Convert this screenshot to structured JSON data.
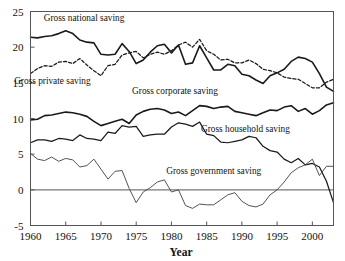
{
  "chart_data": {
    "type": "line",
    "title": "",
    "xlabel": "Year",
    "ylabel": "",
    "xlim": [
      1960,
      2003
    ],
    "ylim": [
      -5,
      25
    ],
    "grid": false,
    "legend": "inline-labels",
    "xticks": [
      1960,
      1965,
      1970,
      1975,
      1980,
      1985,
      1990,
      1995,
      2000
    ],
    "xtick_labels": [
      "1960",
      "1965",
      "1970",
      "1975",
      "1980",
      "1985",
      "1990",
      "1995",
      "2000"
    ],
    "yticks": [
      -5,
      0,
      5,
      10,
      15,
      20,
      25
    ],
    "ytick_labels": [
      "-5",
      "0",
      "5",
      "10",
      "15",
      "20",
      "25"
    ],
    "x": [
      1960,
      1961,
      1962,
      1963,
      1964,
      1965,
      1966,
      1967,
      1968,
      1969,
      1970,
      1971,
      1972,
      1973,
      1974,
      1975,
      1976,
      1977,
      1978,
      1979,
      1980,
      1981,
      1982,
      1983,
      1984,
      1985,
      1986,
      1987,
      1988,
      1989,
      1990,
      1991,
      1992,
      1993,
      1994,
      1995,
      1996,
      1997,
      1998,
      1999,
      2000,
      2001,
      2002,
      2003
    ],
    "series": [
      {
        "name": "Gross national saving",
        "style": "solid",
        "width": "thick",
        "label_x": 1967.6,
        "label_y": 23.6,
        "values": [
          21.4,
          21.3,
          21.5,
          21.6,
          21.9,
          22.3,
          21.9,
          21.0,
          20.7,
          20.6,
          19.0,
          18.9,
          19.0,
          20.5,
          19.4,
          17.7,
          18.2,
          19.3,
          20.2,
          20.4,
          19.2,
          20.3,
          17.6,
          17.8,
          20.2,
          18.5,
          16.8,
          16.8,
          17.6,
          17.4,
          16.2,
          16.0,
          15.4,
          14.9,
          16.0,
          16.4,
          16.9,
          18.0,
          18.6,
          18.4,
          17.9,
          16.3,
          14.4,
          13.8
        ]
      },
      {
        "name": "Gross private saving",
        "style": "dashed",
        "width": "med",
        "label_x": 1963.1,
        "label_y": 14.9,
        "values": [
          16.3,
          17.0,
          17.4,
          17.3,
          17.9,
          18.0,
          17.7,
          18.4,
          17.5,
          16.7,
          16.0,
          17.4,
          17.6,
          18.9,
          19.2,
          19.4,
          18.5,
          19.0,
          19.3,
          19.0,
          19.5,
          20.3,
          20.7,
          20.0,
          21.1,
          19.5,
          19.0,
          18.2,
          18.3,
          17.8,
          17.8,
          18.2,
          17.7,
          16.9,
          16.7,
          16.4,
          15.8,
          15.6,
          15.5,
          14.9,
          14.3,
          14.3,
          15.1,
          15.5
        ]
      },
      {
        "name": "Gross corporate saving",
        "style": "solid",
        "width": "thick",
        "label_x": 1980.5,
        "label_y": 13.4,
        "values": [
          9.8,
          9.9,
          10.4,
          10.5,
          10.7,
          10.9,
          10.8,
          10.6,
          10.3,
          9.6,
          9.0,
          9.3,
          9.6,
          9.9,
          9.3,
          10.5,
          11.0,
          11.3,
          11.4,
          11.2,
          10.7,
          10.9,
          10.4,
          11.1,
          11.8,
          11.7,
          11.4,
          11.6,
          11.7,
          11.0,
          10.8,
          10.6,
          10.4,
          10.8,
          11.2,
          11.1,
          11.6,
          11.8,
          11.0,
          11.4,
          10.6,
          11.1,
          11.9,
          12.2
        ]
      },
      {
        "name": "Gross household saving",
        "style": "solid",
        "width": "med",
        "label_x": 1990.5,
        "label_y": 8.1,
        "values": [
          6.6,
          7.0,
          7.0,
          6.8,
          7.2,
          7.1,
          6.9,
          7.7,
          7.2,
          7.1,
          6.9,
          8.1,
          7.9,
          9.0,
          8.8,
          8.9,
          7.5,
          7.7,
          7.8,
          7.8,
          8.8,
          9.4,
          9.2,
          8.9,
          9.5,
          7.8,
          7.6,
          6.7,
          6.6,
          6.8,
          7.0,
          7.5,
          7.3,
          6.1,
          5.5,
          5.3,
          4.3,
          3.8,
          4.4,
          3.5,
          3.7,
          3.2,
          1.2,
          -1.8
        ]
      },
      {
        "name": "Gross government saving",
        "style": "solid",
        "width": "thin",
        "label_x": 1986.0,
        "label_y": 2.2,
        "values": [
          5.1,
          4.3,
          4.1,
          4.6,
          4.0,
          4.4,
          4.2,
          3.2,
          3.4,
          4.3,
          2.9,
          1.5,
          2.6,
          2.7,
          0.2,
          -1.8,
          -0.3,
          0.3,
          1.1,
          1.4,
          -0.3,
          0.0,
          -2.2,
          -2.6,
          -2.0,
          -2.1,
          -2.1,
          -1.4,
          -0.7,
          -0.4,
          -1.6,
          -2.2,
          -2.4,
          -2.0,
          -0.7,
          0.0,
          1.1,
          2.4,
          3.1,
          3.5,
          4.3,
          2.0,
          3.3,
          3.3
        ]
      }
    ]
  },
  "axes": {
    "x_title": "Year"
  }
}
